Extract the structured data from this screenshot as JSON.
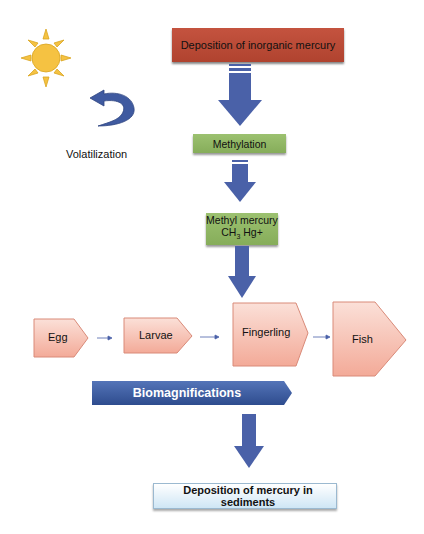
{
  "diagram": {
    "top_box": {
      "label": "Deposition of inorganic mercury",
      "color": "#b84a36"
    },
    "volatilization": {
      "label": "Volatilization",
      "sun_color": "#f5c242",
      "arrow_color": "#3f5aa0"
    },
    "methylation": {
      "label": "Methylation",
      "color": "#94b866"
    },
    "methyl_mercury": {
      "line1": "Methyl mercury",
      "formula_main": "CH",
      "formula_sub": "3",
      "formula_rest": " Hg+",
      "color": "#94b866"
    },
    "life_stages": [
      {
        "label": "Egg"
      },
      {
        "label": "Larvae"
      },
      {
        "label": "Fingerling"
      },
      {
        "label": "Fish"
      }
    ],
    "stage_color": "#f7c4b8",
    "biomagnification": {
      "label": "Biomagnifications",
      "color": "#3a5a9e"
    },
    "bottom_box": {
      "label": "Deposition of mercury in sediments",
      "color": "#dbeefa"
    },
    "arrow_color": "#4a61a8"
  }
}
